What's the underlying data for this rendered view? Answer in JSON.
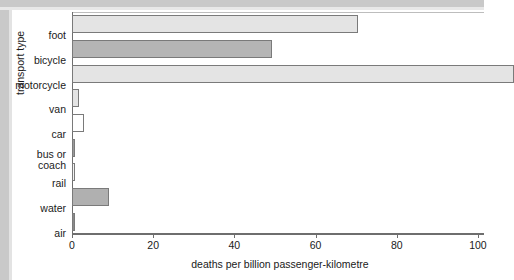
{
  "chart_data": {
    "type": "bar",
    "orientation": "horizontal",
    "title": "",
    "xlabel": "deaths per billion passenger-kilometre",
    "ylabel": "transport type",
    "categories": [
      "foot",
      "bicycle",
      "motorcycle",
      "van",
      "car",
      "bus or\ncoach",
      "rail",
      "water",
      "air"
    ],
    "values": [
      70.4,
      49.3,
      108.9,
      1.7,
      3.0,
      0.35,
      0.6,
      9.1,
      0.25
    ],
    "xlim": [
      0,
      101.5
    ],
    "xticks": [
      0,
      20,
      40,
      60,
      80,
      100
    ],
    "xticklabels": [
      "0",
      "20",
      "40",
      "60",
      "80",
      "100"
    ],
    "grid": false,
    "legend": null,
    "bar_colors": [
      "#e4e4e4",
      "#b5b5b5",
      "#e4e4e4",
      "#e4e4e4",
      "#ffffff",
      "#9a9a9a",
      "#f2f2f2",
      "#b0b0b0",
      "#8a8a8a"
    ]
  },
  "colors": {
    "axis": "#6e6e6e",
    "text": "#1a1a1a",
    "background": "#ffffff",
    "gutter": "#c9c9c9",
    "bar_edge": "#7a7a7a"
  }
}
